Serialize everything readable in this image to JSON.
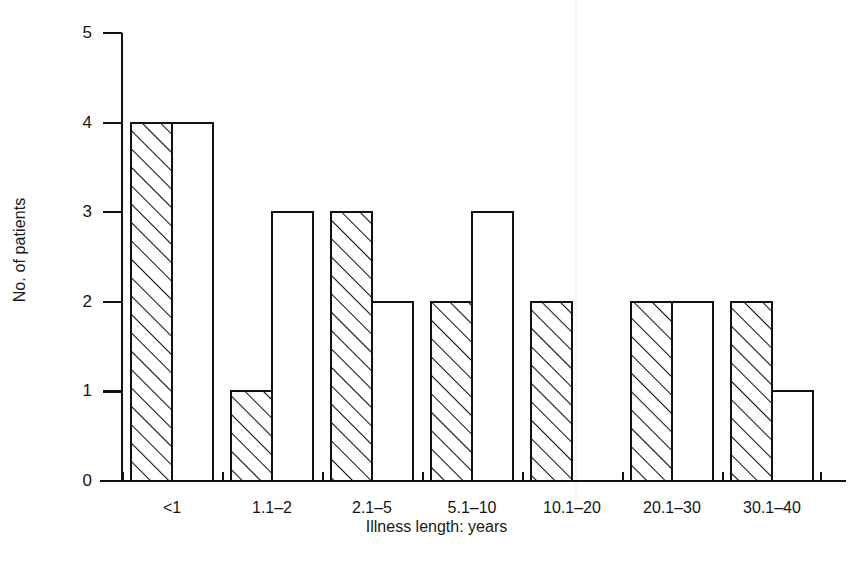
{
  "chart_data": {
    "type": "bar",
    "title": "",
    "subtitle": "",
    "xlabel": "Illness length: years",
    "ylabel": "No. of patients",
    "categories": [
      "<1",
      "1.1–2",
      "2.1–5",
      "5.1–10",
      "10.1–20",
      "20.1–30",
      "30.1–40"
    ],
    "series": [
      {
        "name": "hatched",
        "style": "diagonal-hatch",
        "values": [
          4,
          1,
          3,
          2,
          2,
          2,
          2
        ]
      },
      {
        "name": "open",
        "style": "white-fill",
        "values": [
          4,
          3,
          2,
          3,
          0,
          2,
          1
        ]
      }
    ],
    "ylim": [
      0,
      5
    ],
    "yticks": [
      0,
      1,
      2,
      3,
      4,
      5
    ],
    "ytick_labels": [
      "0",
      "1",
      "2",
      "3",
      "4",
      "5"
    ],
    "grid": false,
    "legend": "none",
    "legend_position": "none",
    "bar_edge_color": "#111111",
    "bar_fill_open": "#ffffff",
    "hatch_color": "#111111",
    "background_color": "#ffffff",
    "axis_color": "#111111"
  },
  "axis": {
    "y_title": "No. of patients",
    "x_title": "Illness length: years"
  }
}
